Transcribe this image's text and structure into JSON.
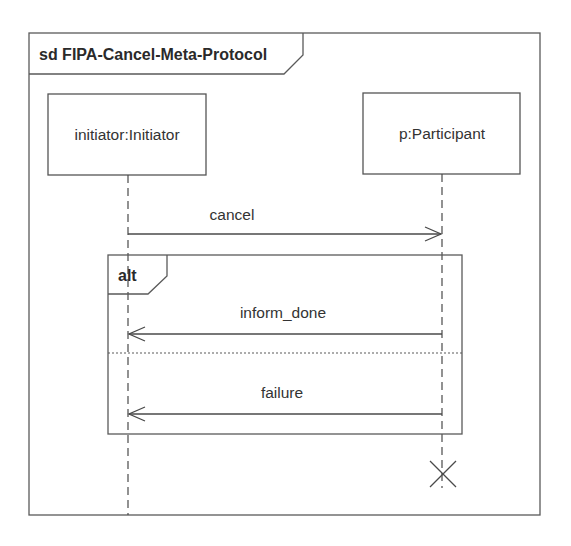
{
  "diagram": {
    "type": "UML sequence diagram",
    "frame": {
      "kind": "sd",
      "name": "FIPA-Cancel-Meta-Protocol",
      "label": "sd FIPA-Cancel-Meta-Protocol"
    },
    "lifelines": [
      {
        "id": "initiator",
        "label": "initiator:Initiator"
      },
      {
        "id": "participant",
        "label": "p:Participant"
      }
    ],
    "messages": [
      {
        "label": "cancel",
        "from": "initiator",
        "to": "participant"
      }
    ],
    "combined_fragment": {
      "operator": "alt",
      "operands": [
        {
          "messages": [
            {
              "label": "inform_done",
              "from": "participant",
              "to": "initiator"
            }
          ]
        },
        {
          "messages": [
            {
              "label": "failure",
              "from": "participant",
              "to": "initiator"
            }
          ]
        }
      ]
    },
    "destruction": {
      "lifeline": "participant",
      "symbol": "X"
    }
  },
  "colors": {
    "line": "#5a5a5a",
    "text": "#333333",
    "background": "#ffffff"
  }
}
